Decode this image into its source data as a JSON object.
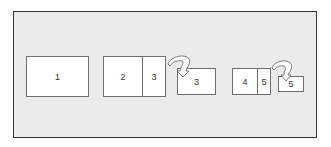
{
  "diagram": {
    "colors": {
      "frame_background": "#ebebeb",
      "frame_border": "#333333",
      "box_fill": "#ffffff",
      "box_border": "#6e6e6e",
      "text": "#333333"
    },
    "panels": [
      {
        "id": "panel-1",
        "cells": [
          "1"
        ]
      },
      {
        "id": "panel-2-3",
        "cells": [
          "2",
          "3"
        ]
      },
      {
        "id": "panel-3-folded",
        "cells": [
          "3"
        ]
      },
      {
        "id": "panel-4-5",
        "cells": [
          "4",
          "5"
        ]
      },
      {
        "id": "panel-5-folded",
        "cells": [
          "5"
        ]
      }
    ],
    "arrows": [
      {
        "id": "fold-arrow-3",
        "from": "panel-2-3",
        "to": "panel-3-folded"
      },
      {
        "id": "fold-arrow-5",
        "from": "panel-4-5",
        "to": "panel-5-folded"
      }
    ]
  }
}
